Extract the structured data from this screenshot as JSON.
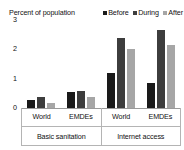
{
  "chart_data": {
    "type": "bar",
    "title": "Percent of population",
    "xlabel": "",
    "ylabel": "",
    "ylim": [
      0,
      3
    ],
    "yticks": [
      "0",
      "1",
      "2",
      "3"
    ],
    "ytick_values": [
      0,
      1,
      2,
      3
    ],
    "grid": false,
    "legend_position": "top-right",
    "legend": [
      "Before",
      "During",
      "After"
    ],
    "series": [
      {
        "name": "Before",
        "color": "#1a1a1a",
        "values": [
          0.27,
          0.55,
          1.2,
          0.85
        ]
      },
      {
        "name": "During",
        "color": "#3d3d3d",
        "values": [
          0.37,
          0.58,
          2.4,
          2.65
        ]
      },
      {
        "name": "After",
        "color": "#a6a6a6",
        "values": [
          0.17,
          0.37,
          2.0,
          2.15
        ]
      }
    ],
    "categories": [
      "World",
      "EMDEs",
      "World",
      "EMDEs"
    ],
    "supercategories": [
      {
        "label": "Basic sanitation",
        "span": 2
      },
      {
        "label": "Internet access",
        "span": 2
      }
    ]
  },
  "colors": {
    "before": "#1a1a1a",
    "during": "#3d3d3d",
    "after": "#a6a6a6",
    "axis": "#9a9a9a",
    "table_border": "#b4b4b4",
    "background": "#ffffff"
  }
}
